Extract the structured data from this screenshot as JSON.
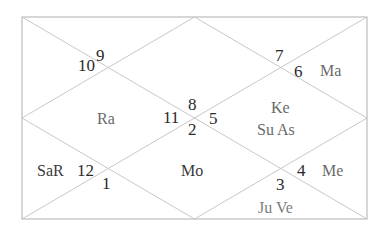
{
  "chart_title": "",
  "chart_style": "North Indian Kundli",
  "colors": {
    "lines": "#c8c8c8",
    "house_numbers": "#2a2a2a",
    "planets": "#6a6a6a",
    "planets_dark": "#3a3a3a",
    "planets_light": "#7d7d7d"
  },
  "houses": [
    {
      "id": "top-center",
      "sign_number": "8",
      "planets": "Ke Su As"
    },
    {
      "id": "top-left",
      "sign_number": "9",
      "planets": ""
    },
    {
      "id": "left-upper",
      "sign_number": "10",
      "planets": ""
    },
    {
      "id": "left-center",
      "sign_number": "11",
      "planets": "Ra"
    },
    {
      "id": "left-lower",
      "sign_number": "12",
      "planets": "SaR"
    },
    {
      "id": "bottom-left",
      "sign_number": "1",
      "planets": ""
    },
    {
      "id": "bottom-center",
      "sign_number": "2",
      "planets": "Mo"
    },
    {
      "id": "bottom-right",
      "sign_number": "3",
      "planets": "Ju Ve"
    },
    {
      "id": "right-lower",
      "sign_number": "4",
      "planets": "Me"
    },
    {
      "id": "right-center",
      "sign_number": "5",
      "planets": ""
    },
    {
      "id": "right-upper",
      "sign_number": "6",
      "planets": "Ma"
    },
    {
      "id": "top-right",
      "sign_number": "7",
      "planets": ""
    }
  ],
  "labels": {
    "n9": "9",
    "n10": "10",
    "n7": "7",
    "n6": "6",
    "ma": "Ma",
    "ra": "Ra",
    "n8": "8",
    "n11": "11",
    "n2": "2",
    "n5": "5",
    "ke": "Ke",
    "su_as": "Su As",
    "sar": "SaR",
    "n12": "12",
    "n1": "1",
    "mo": "Mo",
    "n4": "4",
    "me": "Me",
    "n3": "3",
    "ju_ve": "Ju Ve"
  }
}
